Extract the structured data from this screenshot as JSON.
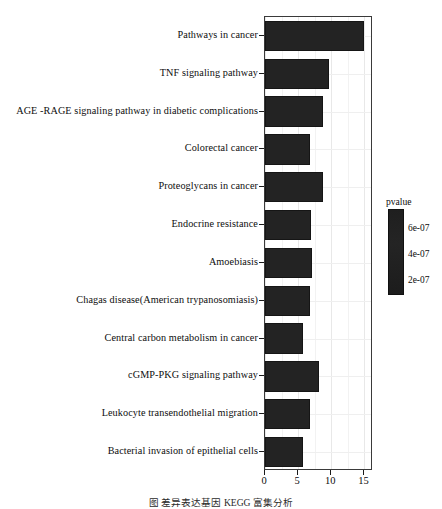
{
  "chart_data": {
    "type": "bar",
    "orientation": "horizontal",
    "title": "",
    "xlabel": "",
    "ylabel": "",
    "xlim": [
      0,
      16.3
    ],
    "xticks": [
      0,
      5,
      10,
      15
    ],
    "xticklabels": [
      "0",
      "5",
      "10",
      "15"
    ],
    "grid": true,
    "categories": [
      "Pathways in cancer",
      "TNF signaling pathway",
      "AGE -RAGE signaling pathway in diabetic complications",
      "Colorectal cancer",
      "Proteoglycans in cancer",
      "Endocrine resistance",
      "Amoebiasis",
      "Chagas disease(American trypanosomiasis)",
      "Central carbon metabolism in cancer",
      "cGMP-PKG signaling pathway",
      "Leukocyte transendothelial migration",
      "Bacterial invasion of epithelial cells"
    ],
    "values": [
      15,
      9.7,
      8.8,
      6.8,
      8.7,
      7.0,
      7.1,
      6.8,
      5.7,
      8.2,
      6.8,
      5.8
    ],
    "bar_color": "#232323",
    "legend": {
      "title": "pvalue",
      "position": "right",
      "ticks": [
        "6e-07",
        "4e-07",
        "2e-07"
      ],
      "tick_fractions": [
        0.22,
        0.52,
        0.82
      ]
    }
  },
  "caption": "图   差异表达基因 KEGG 富集分析",
  "axis": {
    "ticks": [
      {
        "label": "0",
        "value": 0
      },
      {
        "label": "5",
        "value": 5
      },
      {
        "label": "10",
        "value": 10
      },
      {
        "label": "15",
        "value": 15
      }
    ]
  }
}
